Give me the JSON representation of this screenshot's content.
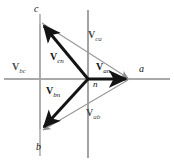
{
  "diagram": {
    "colors": {
      "axis": "#8c8c8c",
      "phase_vector": "#141414",
      "line_vector": "#9a9a9a",
      "background": "#ffffff",
      "label_dark": "#111111",
      "label_gray": "#4a4a4a"
    },
    "axes": {
      "horizontal_y": 79,
      "vertical_x": 88,
      "secondary_vertical_x": 40
    },
    "nodes": [
      {
        "id": "a",
        "label": "a",
        "x": 130,
        "y": 79,
        "label_x": 139,
        "label_y": 66
      },
      {
        "id": "b",
        "label": "b",
        "x": 40,
        "y": 131,
        "label_x": 36,
        "label_y": 142
      },
      {
        "id": "c",
        "label": "c",
        "x": 40,
        "y": 22,
        "label_x": 34,
        "label_y": 6
      },
      {
        "id": "n",
        "label": "n",
        "x": 88,
        "y": 79,
        "label_x": 93,
        "label_y": 82
      }
    ],
    "phase_vectors": [
      {
        "name": "V-an",
        "symbol": "V",
        "subscript": "an",
        "from": {
          "x": 88,
          "y": 79
        },
        "to": {
          "x": 130,
          "y": 79
        },
        "label_x": 96,
        "label_y": 68
      },
      {
        "name": "V-bn",
        "symbol": "V",
        "subscript": "bn",
        "from": {
          "x": 88,
          "y": 79
        },
        "to": {
          "x": 40,
          "y": 131
        },
        "label_x": 48,
        "label_y": 88
      },
      {
        "name": "V-cn",
        "symbol": "V",
        "subscript": "cn",
        "from": {
          "x": 88,
          "y": 79
        },
        "to": {
          "x": 40,
          "y": 22
        },
        "label_x": 50,
        "label_y": 58
      }
    ],
    "line_vectors": [
      {
        "name": "V-ab",
        "symbol": "V",
        "subscript": "ab",
        "from": {
          "x": 130,
          "y": 79
        },
        "to": {
          "x": 40,
          "y": 131
        },
        "label_x": 89,
        "label_y": 113
      },
      {
        "name": "V-bc",
        "symbol": "V",
        "subscript": "bc",
        "from": {
          "x": 40,
          "y": 131
        },
        "to": {
          "x": 40,
          "y": 22
        },
        "label_x": 14,
        "label_y": 67
      },
      {
        "name": "V-ca",
        "symbol": "V",
        "subscript": "ca",
        "from": {
          "x": 40,
          "y": 22
        },
        "to": {
          "x": 130,
          "y": 79
        },
        "label_x": 88,
        "label_y": 33
      }
    ]
  }
}
